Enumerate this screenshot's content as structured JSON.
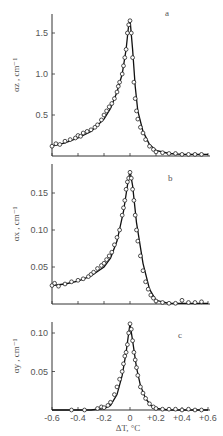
{
  "figure": {
    "xlabel": "ΔT, °C",
    "x_ticks": [
      "-0.6",
      "-0.4",
      "-0.2",
      "0",
      "+0.2",
      "+0.4",
      "+0.6"
    ]
  },
  "panels": [
    {
      "letter": "a",
      "ylabel": "α_z , cm⁻¹",
      "y_ticks": [
        "0.5",
        "1.0",
        "1.5"
      ]
    },
    {
      "letter": "b",
      "ylabel": "α_x , cm⁻¹",
      "y_ticks": [
        "0.05",
        "0.10",
        "0.15"
      ]
    },
    {
      "letter": "c",
      "ylabel": "α_y , cm⁻¹",
      "y_ticks": [
        "0.05",
        "0.10"
      ]
    }
  ],
  "chart_data": [
    {
      "type": "scatter",
      "title": "a",
      "xlabel": "ΔT, °C",
      "ylabel": "αz, cm^-1",
      "xlim": [
        -0.6,
        0.6
      ],
      "ylim": [
        0,
        1.7
      ],
      "x_ticks": [
        -0.6,
        -0.4,
        -0.2,
        0,
        0.2,
        0.4,
        0.6
      ],
      "y_ticks": [
        0.5,
        1.0,
        1.5
      ],
      "series": [
        {
          "name": "measured (circles)",
          "x": [
            -0.6,
            -0.57,
            -0.54,
            -0.5,
            -0.46,
            -0.42,
            -0.4,
            -0.38,
            -0.36,
            -0.33,
            -0.3,
            -0.27,
            -0.25,
            -0.22,
            -0.2,
            -0.18,
            -0.16,
            -0.14,
            -0.12,
            -0.1,
            -0.09,
            -0.08,
            -0.06,
            -0.05,
            -0.04,
            -0.03,
            -0.02,
            -0.01,
            0.0,
            0.01,
            0.02,
            0.03,
            0.04,
            0.05,
            0.06,
            0.08,
            0.1,
            0.12,
            0.15,
            0.18,
            0.2,
            0.25,
            0.3,
            0.35,
            0.4,
            0.45,
            0.5,
            0.55
          ],
          "y": [
            0.12,
            0.15,
            0.14,
            0.18,
            0.2,
            0.22,
            0.25,
            0.24,
            0.28,
            0.3,
            0.32,
            0.35,
            0.38,
            0.44,
            0.5,
            0.55,
            0.6,
            0.64,
            0.7,
            0.78,
            0.85,
            0.9,
            1.0,
            1.1,
            1.2,
            1.3,
            1.5,
            1.6,
            1.65,
            1.5,
            1.2,
            0.9,
            0.7,
            0.55,
            0.45,
            0.35,
            0.28,
            0.2,
            0.12,
            0.08,
            0.05,
            0.04,
            0.03,
            0.03,
            0.02,
            0.02,
            0.02,
            0.02
          ]
        },
        {
          "name": "fit (line)",
          "x": [
            -0.6,
            -0.5,
            -0.4,
            -0.3,
            -0.2,
            -0.15,
            -0.1,
            -0.06,
            -0.03,
            -0.01,
            0.0,
            0.02,
            0.04,
            0.06,
            0.1,
            0.15,
            0.2,
            0.3,
            0.4,
            0.5,
            0.6
          ],
          "y": [
            0.12,
            0.16,
            0.22,
            0.3,
            0.45,
            0.58,
            0.78,
            1.0,
            1.3,
            1.6,
            1.67,
            1.3,
            0.85,
            0.55,
            0.3,
            0.14,
            0.07,
            0.03,
            0.02,
            0.02,
            0.02
          ]
        }
      ],
      "grid": false
    },
    {
      "type": "scatter",
      "title": "b",
      "xlabel": "ΔT, °C",
      "ylabel": "αx, cm^-1",
      "xlim": [
        -0.6,
        0.6
      ],
      "ylim": [
        0,
        0.18
      ],
      "x_ticks": [
        -0.6,
        -0.4,
        -0.2,
        0,
        0.2,
        0.4,
        0.6
      ],
      "y_ticks": [
        0.05,
        0.1,
        0.15
      ],
      "series": [
        {
          "name": "measured (circles)",
          "x": [
            -0.6,
            -0.58,
            -0.55,
            -0.5,
            -0.45,
            -0.4,
            -0.36,
            -0.32,
            -0.3,
            -0.28,
            -0.25,
            -0.22,
            -0.2,
            -0.18,
            -0.16,
            -0.14,
            -0.12,
            -0.1,
            -0.08,
            -0.06,
            -0.05,
            -0.04,
            -0.03,
            -0.02,
            -0.01,
            0.0,
            0.01,
            0.02,
            0.03,
            0.04,
            0.05,
            0.06,
            0.08,
            0.1,
            0.12,
            0.14,
            0.16,
            0.18,
            0.2,
            0.25,
            0.3,
            0.35,
            0.4,
            0.45,
            0.5,
            0.55
          ],
          "y": [
            0.025,
            0.028,
            0.024,
            0.027,
            0.03,
            0.032,
            0.034,
            0.037,
            0.04,
            0.043,
            0.048,
            0.052,
            0.055,
            0.06,
            0.065,
            0.07,
            0.08,
            0.09,
            0.1,
            0.12,
            0.13,
            0.14,
            0.155,
            0.165,
            0.17,
            0.178,
            0.17,
            0.155,
            0.14,
            0.12,
            0.1,
            0.085,
            0.065,
            0.045,
            0.03,
            0.02,
            0.012,
            0.008,
            0.004,
            0.002,
            0.001,
            0.001,
            0.005,
            0.002,
            0.002,
            0.003
          ]
        },
        {
          "name": "fit (line)",
          "x": [
            -0.6,
            -0.5,
            -0.4,
            -0.3,
            -0.2,
            -0.15,
            -0.1,
            -0.05,
            -0.02,
            0.0,
            0.02,
            0.05,
            0.1,
            0.15,
            0.2,
            0.3,
            0.4,
            0.5,
            0.6
          ],
          "y": [
            0.025,
            0.027,
            0.031,
            0.038,
            0.05,
            0.062,
            0.085,
            0.125,
            0.16,
            0.18,
            0.16,
            0.11,
            0.055,
            0.02,
            0.005,
            0.001,
            0.001,
            0.001,
            0.001
          ]
        }
      ],
      "grid": false
    },
    {
      "type": "scatter",
      "title": "c",
      "xlabel": "ΔT, °C",
      "ylabel": "αy, cm^-1",
      "xlim": [
        -0.6,
        0.6
      ],
      "ylim": [
        0,
        0.115
      ],
      "x_ticks": [
        -0.6,
        -0.4,
        -0.2,
        0,
        0.2,
        0.4,
        0.6
      ],
      "y_ticks": [
        0.05,
        0.1
      ],
      "series": [
        {
          "name": "measured (circles)",
          "x": [
            -0.45,
            -0.35,
            -0.25,
            -0.22,
            -0.2,
            -0.17,
            -0.15,
            -0.12,
            -0.1,
            -0.08,
            -0.06,
            -0.05,
            -0.04,
            -0.03,
            -0.02,
            -0.01,
            0.0,
            0.01,
            0.02,
            0.03,
            0.04,
            0.05,
            0.06,
            0.08,
            0.1,
            0.12,
            0.15,
            0.18,
            0.2,
            0.25,
            0.3,
            0.35,
            0.4,
            0.45,
            0.5,
            0.55
          ],
          "y": [
            0.0,
            0.0,
            0.002,
            0.004,
            0.003,
            0.006,
            0.01,
            0.02,
            0.03,
            0.04,
            0.05,
            0.06,
            0.07,
            0.075,
            0.085,
            0.1,
            0.112,
            0.105,
            0.09,
            0.075,
            0.065,
            0.055,
            0.045,
            0.03,
            0.022,
            0.015,
            0.008,
            0.004,
            0.002,
            0.001,
            0.001,
            0.001,
            0.0,
            0.001,
            0.0,
            0.0
          ]
        },
        {
          "name": "fit (line)",
          "x": [
            -0.6,
            -0.3,
            -0.2,
            -0.15,
            -0.1,
            -0.06,
            -0.03,
            -0.01,
            0.0,
            0.02,
            0.05,
            0.08,
            0.12,
            0.16,
            0.2,
            0.3,
            0.6
          ],
          "y": [
            0.0,
            0.0,
            0.002,
            0.006,
            0.02,
            0.045,
            0.075,
            0.1,
            0.112,
            0.09,
            0.055,
            0.032,
            0.015,
            0.006,
            0.002,
            0.0,
            0.0
          ]
        }
      ],
      "grid": false
    }
  ]
}
